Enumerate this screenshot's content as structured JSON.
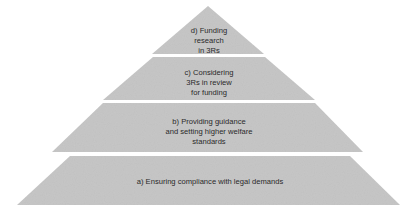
{
  "diagram": {
    "type": "pyramid",
    "fill_color": "#c8c8c8",
    "text_color": "#2a2a2a",
    "tiers": [
      {
        "id": "d",
        "level": "top",
        "lines": [
          "d) Funding",
          "research",
          "in 3Rs"
        ]
      },
      {
        "id": "c",
        "level": "upper-middle",
        "lines": [
          "c) Considering",
          "3Rs in review",
          "for funding"
        ]
      },
      {
        "id": "b",
        "level": "lower-middle",
        "lines": [
          "b) Providing guidance",
          "and setting higher welfare",
          "standards"
        ]
      },
      {
        "id": "a",
        "level": "base",
        "lines": [
          "a) Ensuring compliance with legal demands"
        ]
      }
    ]
  }
}
